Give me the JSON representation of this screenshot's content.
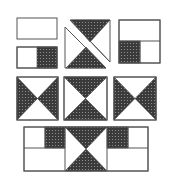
{
  "diagram": {
    "title": "",
    "colors": {
      "shade": "#3a3a3a",
      "shade_dot": "#9a9a9a",
      "outline": "#555555",
      "background": "#ffffff"
    },
    "rows": [
      {
        "name": "row-1",
        "pieces": [
          "plain-rectangle",
          "half-shaded-rectangle",
          "split-hourglass-square",
          "square-with-quarter-shaded"
        ]
      },
      {
        "name": "row-2",
        "pieces": [
          "hourglass-side-shaded",
          "hourglass-top-bottom-shaded",
          "hourglass-side-shaded"
        ]
      },
      {
        "name": "row-3",
        "pieces": [
          "assembled-strip-with-center-hourglass"
        ]
      }
    ]
  }
}
